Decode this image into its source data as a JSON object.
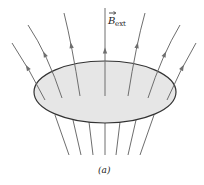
{
  "figure": {
    "field_label": {
      "symbol": "B",
      "subscript": "ext",
      "vector_arrow": true
    },
    "caption": "(a)",
    "field_line_count": 9,
    "lower_line_count": 7,
    "colors": {
      "field_lines": "#6e6e6e",
      "loop_fill": "#e6e6e6",
      "loop_stroke": "#333333",
      "text": "#222222"
    }
  }
}
